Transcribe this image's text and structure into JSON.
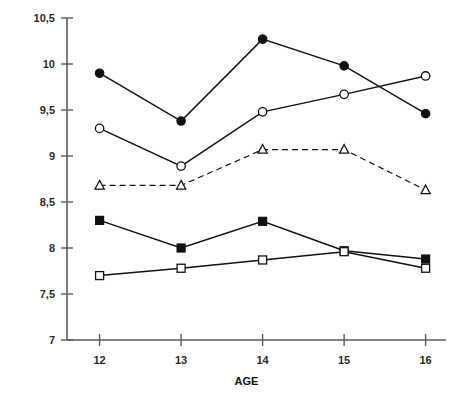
{
  "chart_data": {
    "type": "line",
    "title": "",
    "subtitle": "",
    "xlabel": "AGE",
    "ylabel": "",
    "x": [
      12,
      13,
      14,
      15,
      16
    ],
    "categories": [
      "12",
      "13",
      "14",
      "15",
      "16"
    ],
    "xtick_labels": [
      "12",
      "13",
      "14",
      "15",
      "16"
    ],
    "ytick_labels": [
      "7",
      "7,5",
      "8",
      "8,5",
      "9",
      "9,5",
      "10",
      "10,5"
    ],
    "ytick_values": [
      7,
      7.5,
      8,
      8.5,
      9,
      9.5,
      10,
      10.5
    ],
    "xlim": [
      11.6,
      16.25
    ],
    "ylim": [
      7,
      10.5
    ],
    "grid": false,
    "legend": "none",
    "decimal_separator": ",",
    "series": [
      {
        "name": "filled-circle-series",
        "marker": "filled-circle",
        "linestyle": "solid",
        "color": "#111111",
        "values": [
          9.9,
          9.38,
          10.27,
          9.98,
          9.46
        ]
      },
      {
        "name": "open-circle-series",
        "marker": "open-circle",
        "linestyle": "solid",
        "color": "#111111",
        "values": [
          9.3,
          8.89,
          9.48,
          9.67,
          9.87
        ]
      },
      {
        "name": "open-triangle-series",
        "marker": "open-triangle",
        "linestyle": "dashed",
        "color": "#111111",
        "values": [
          8.68,
          8.68,
          9.07,
          9.07,
          8.63
        ]
      },
      {
        "name": "filled-square-series",
        "marker": "filled-square",
        "linestyle": "solid",
        "color": "#111111",
        "values": [
          8.3,
          8.0,
          8.29,
          7.97,
          7.88
        ]
      },
      {
        "name": "open-square-series",
        "marker": "open-square",
        "linestyle": "solid",
        "color": "#111111",
        "values": [
          7.7,
          7.78,
          7.87,
          7.96,
          7.78
        ]
      }
    ]
  },
  "axes": {
    "x_axis_title": "AGE"
  }
}
